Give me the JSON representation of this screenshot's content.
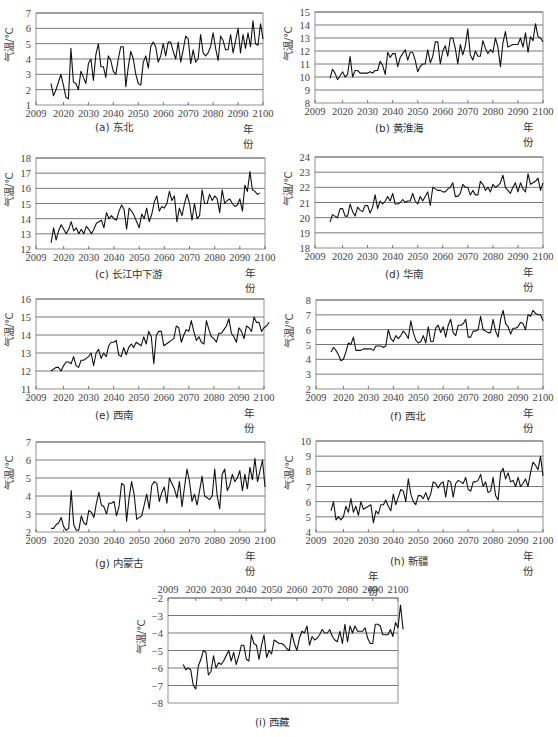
{
  "figure": {
    "ylabel": "气温/℃",
    "xlabel": "年份"
  },
  "chart_data": [
    {
      "id": "a",
      "type": "line",
      "title": "(a) 东北",
      "xlabel": "年份",
      "ylabel": "气温/℃",
      "xlim": [
        2009,
        2100
      ],
      "ylim": [
        1,
        7
      ],
      "grid": true,
      "x_ticks": [
        2009,
        2020,
        2030,
        2040,
        2050,
        2060,
        2070,
        2080,
        2090,
        2100
      ],
      "y_ticks": [
        1,
        2,
        3,
        4,
        5,
        6,
        7
      ],
      "x_start": 2015,
      "values": [
        2.4,
        1.6,
        2.0,
        2.5,
        3.0,
        2.3,
        1.5,
        1.4,
        4.7,
        2.5,
        2.4,
        2.0,
        3.2,
        2.8,
        2.4,
        3.7,
        4.0,
        2.6,
        4.3,
        5.0,
        3.5,
        3.5,
        2.8,
        4.2,
        3.9,
        3.2,
        3.0,
        4.0,
        4.8,
        4.8,
        2.2,
        3.5,
        4.5,
        4.0,
        3.0,
        2.4,
        2.3,
        3.8,
        4.2,
        3.4,
        4.8,
        5.1,
        4.8,
        3.8,
        4.2,
        5.0,
        4.2,
        5.1,
        5.1,
        4.5,
        4.0,
        5.1,
        3.8,
        4.6,
        5.5,
        5.3,
        3.7,
        4.6,
        3.8,
        4.0,
        5.6,
        4.4,
        4.2,
        4.4,
        4.8,
        5.7,
        4.7,
        3.9,
        5.5,
        5.2,
        4.6,
        4.6,
        5.6,
        4.4,
        5.2,
        6.0,
        4.4,
        5.6,
        4.7,
        5.7,
        4.8,
        6.5,
        5.0,
        4.9,
        6.3,
        5.3
      ]
    },
    {
      "id": "b",
      "type": "line",
      "title": "(b) 黄淮海",
      "xlabel": "年份",
      "ylabel": "气温/℃",
      "xlim": [
        2009,
        2100
      ],
      "ylim": [
        8,
        15
      ],
      "grid": true,
      "x_ticks": [
        2009,
        2020,
        2030,
        2040,
        2050,
        2060,
        2070,
        2080,
        2090,
        2100
      ],
      "y_ticks": [
        8,
        9,
        10,
        11,
        12,
        13,
        14,
        15
      ],
      "x_start": 2015,
      "values": [
        9.9,
        10.6,
        10.3,
        9.8,
        10.1,
        10.4,
        10.0,
        10.2,
        11.6,
        10.0,
        10.5,
        10.5,
        10.3,
        10.3,
        10.3,
        10.3,
        10.4,
        10.3,
        10.5,
        10.5,
        11.2,
        10.9,
        10.2,
        11.9,
        11.5,
        11.8,
        11.8,
        10.8,
        11.5,
        11.8,
        12.1,
        11.3,
        11.9,
        11.9,
        11.3,
        10.4,
        10.8,
        11.0,
        11.0,
        12.1,
        11.1,
        11.6,
        12.7,
        12.7,
        11.0,
        12.0,
        12.4,
        11.6,
        13.0,
        13.0,
        12.2,
        11.0,
        12.5,
        11.7,
        12.4,
        13.7,
        11.7,
        11.3,
        12.0,
        11.6,
        11.6,
        12.8,
        12.2,
        11.8,
        12.1,
        11.9,
        13.0,
        12.3,
        10.8,
        12.6,
        13.5,
        12.3,
        12.4,
        12.5,
        12.5,
        12.5,
        13.0,
        12.3,
        13.4,
        11.9,
        13.1,
        12.8,
        14.1,
        13.1,
        13.0,
        12.7
      ]
    },
    {
      "id": "c",
      "type": "line",
      "title": "(c) 长江中下游",
      "xlabel": "年份",
      "ylabel": "气温/℃",
      "xlim": [
        2009,
        2100
      ],
      "ylim": [
        12,
        18
      ],
      "grid": true,
      "x_ticks": [
        2009,
        2020,
        2030,
        2040,
        2050,
        2060,
        2070,
        2080,
        2090,
        2100
      ],
      "y_ticks": [
        12,
        13,
        14,
        15,
        16,
        17,
        18
      ],
      "x_start": 2015,
      "values": [
        12.4,
        13.4,
        12.6,
        13.2,
        13.6,
        13.3,
        13.0,
        13.3,
        13.8,
        13.2,
        13.4,
        13.0,
        13.3,
        13.0,
        13.5,
        13.3,
        13.0,
        13.3,
        13.7,
        13.8,
        13.9,
        13.4,
        14.4,
        14.0,
        14.2,
        14.0,
        13.9,
        14.5,
        14.9,
        14.6,
        13.3,
        14.7,
        14.5,
        14.2,
        13.8,
        13.4,
        14.3,
        14.0,
        14.7,
        13.8,
        14.3,
        15.1,
        15.5,
        14.5,
        14.8,
        14.7,
        15.0,
        15.8,
        15.2,
        15.5,
        13.8,
        14.7,
        14.2,
        15.0,
        15.6,
        15.0,
        13.9,
        15.0,
        14.0,
        14.2,
        15.9,
        15.0,
        15.0,
        15.6,
        15.2,
        15.5,
        15.3,
        14.4,
        15.9,
        15.0,
        15.2,
        15.3,
        15.0,
        14.8,
        14.9,
        15.3,
        14.5,
        16.2,
        15.8,
        17.1,
        15.9,
        15.8,
        15.6,
        15.7
      ]
    },
    {
      "id": "d",
      "type": "line",
      "title": "(d) 华南",
      "xlabel": "年份",
      "ylabel": "气温/℃",
      "xlim": [
        2009,
        2100
      ],
      "ylim": [
        18,
        24
      ],
      "grid": true,
      "x_ticks": [
        2009,
        2020,
        2030,
        2040,
        2050,
        2060,
        2070,
        2080,
        2090,
        2100
      ],
      "y_ticks": [
        18,
        19,
        20,
        21,
        22,
        23,
        24
      ],
      "x_start": 2015,
      "values": [
        19.7,
        20.2,
        20.1,
        20.0,
        20.6,
        20.6,
        20.1,
        20.1,
        20.9,
        20.4,
        20.1,
        20.7,
        20.5,
        20.4,
        20.8,
        20.8,
        20.3,
        20.7,
        21.5,
        20.6,
        21.1,
        20.9,
        21.1,
        21.4,
        21.1,
        21.6,
        20.9,
        20.9,
        21.0,
        21.2,
        21.0,
        21.1,
        21.1,
        21.6,
        21.1,
        20.9,
        21.4,
        21.1,
        21.4,
        21.7,
        20.8,
        22.0,
        21.9,
        21.8,
        21.8,
        21.7,
        21.7,
        21.9,
        22.0,
        22.3,
        21.4,
        21.4,
        21.6,
        22.2,
        22.0,
        22.0,
        21.5,
        21.8,
        21.5,
        21.5,
        22.4,
        22.2,
        21.8,
        22.0,
        21.7,
        22.2,
        22.0,
        22.1,
        22.3,
        22.8,
        22.0,
        21.8,
        21.6,
        22.0,
        22.3,
        21.7,
        22.3,
        21.9,
        21.7,
        22.9,
        22.2,
        22.3,
        22.4,
        22.6,
        21.8,
        22.3
      ]
    },
    {
      "id": "e",
      "type": "line",
      "title": "(e) 西南",
      "xlabel": "年份",
      "ylabel": "气温/℃",
      "xlim": [
        2009,
        2100
      ],
      "ylim": [
        11,
        16
      ],
      "grid": true,
      "x_ticks": [
        2009,
        2020,
        2030,
        2040,
        2050,
        2060,
        2070,
        2080,
        2090,
        2100
      ],
      "y_ticks": [
        11,
        12,
        13,
        14,
        15,
        16
      ],
      "x_start": 2015,
      "values": [
        12.0,
        12.1,
        12.2,
        12.2,
        12.0,
        12.3,
        12.5,
        12.5,
        12.4,
        12.8,
        12.3,
        12.2,
        12.6,
        12.6,
        12.7,
        12.8,
        13.0,
        12.3,
        13.0,
        13.2,
        12.7,
        13.0,
        12.8,
        13.4,
        13.6,
        13.6,
        13.7,
        12.9,
        12.8,
        13.3,
        12.9,
        13.3,
        13.5,
        13.3,
        13.6,
        13.5,
        13.4,
        13.9,
        13.5,
        14.2,
        13.9,
        12.4,
        14.0,
        14.2,
        14.2,
        13.4,
        13.5,
        13.6,
        13.7,
        13.8,
        14.5,
        14.4,
        13.6,
        14.0,
        14.3,
        14.2,
        14.8,
        14.2,
        13.7,
        13.9,
        13.6,
        13.5,
        14.8,
        14.3,
        13.9,
        13.8,
        13.6,
        14.1,
        14.1,
        14.3,
        14.5,
        14.9,
        14.1,
        13.9,
        13.6,
        14.4,
        14.2,
        13.8,
        14.5,
        14.4,
        14.2,
        15.0,
        14.7,
        14.7,
        14.2,
        14.4,
        14.5,
        14.7
      ]
    },
    {
      "id": "f",
      "type": "line",
      "title": "(f) 西北",
      "xlabel": "年份",
      "ylabel": "气温/℃",
      "xlim": [
        2009,
        2100
      ],
      "ylim": [
        2,
        8
      ],
      "grid": true,
      "x_ticks": [
        2009,
        2020,
        2030,
        2040,
        2050,
        2060,
        2070,
        2080,
        2090,
        2100
      ],
      "y_ticks": [
        2,
        3,
        4,
        5,
        6,
        7,
        8
      ],
      "x_start": 2015,
      "values": [
        4.5,
        4.8,
        4.6,
        4.3,
        3.9,
        4.0,
        4.5,
        5.1,
        5.0,
        5.5,
        4.6,
        4.6,
        4.6,
        4.7,
        4.7,
        4.7,
        4.7,
        4.6,
        4.9,
        4.9,
        4.9,
        4.8,
        4.9,
        6.0,
        5.4,
        5.2,
        5.6,
        5.4,
        5.6,
        5.9,
        5.7,
        5.4,
        6.6,
        5.8,
        5.3,
        5.1,
        5.2,
        5.6,
        5.1,
        6.2,
        5.2,
        5.2,
        6.1,
        6.3,
        5.8,
        6.2,
        5.5,
        6.3,
        6.7,
        5.8,
        5.6,
        6.3,
        6.3,
        6.4,
        6.7,
        5.5,
        5.5,
        5.9,
        5.9,
        6.0,
        6.9,
        6.0,
        5.9,
        5.8,
        5.8,
        6.7,
        5.9,
        5.5,
        6.7,
        7.3,
        6.4,
        6.2,
        5.7,
        6.1,
        6.1,
        6.2,
        6.5,
        6.4,
        6.0,
        7.0,
        6.9,
        7.3,
        7.1,
        7.0,
        7.0,
        6.6
      ]
    },
    {
      "id": "g",
      "type": "line",
      "title": "(g) 内蒙古",
      "xlabel": "年份",
      "ylabel": "气温/℃",
      "xlim": [
        2009,
        2100
      ],
      "ylim": [
        2,
        7
      ],
      "grid": true,
      "x_ticks": [
        2009,
        2020,
        2030,
        2040,
        2050,
        2060,
        2070,
        2080,
        2090,
        2100
      ],
      "y_ticks": [
        2,
        3,
        4,
        5,
        6,
        7
      ],
      "x_start": 2015,
      "values": [
        2.2,
        2.2,
        2.4,
        2.5,
        2.8,
        2.3,
        2.1,
        2.2,
        4.3,
        2.4,
        2.1,
        2.1,
        2.9,
        2.5,
        2.4,
        3.2,
        3.1,
        2.8,
        3.6,
        4.2,
        3.5,
        3.4,
        3.0,
        3.6,
        3.6,
        3.7,
        2.9,
        3.4,
        4.7,
        4.6,
        2.6,
        3.9,
        4.8,
        4.1,
        2.7,
        2.8,
        2.9,
        3.5,
        4.1,
        3.3,
        4.6,
        4.8,
        4.7,
        3.7,
        4.2,
        4.5,
        3.6,
        5.0,
        4.7,
        4.4,
        3.9,
        4.8,
        3.4,
        4.5,
        5.5,
        4.8,
        3.7,
        4.1,
        3.5,
        4.3,
        5.1,
        4.0,
        3.9,
        3.8,
        4.0,
        5.5,
        4.0,
        3.3,
        5.2,
        5.5,
        4.3,
        4.6,
        5.2,
        4.8,
        5.0,
        5.4,
        4.3,
        5.2,
        4.4,
        5.6,
        4.9,
        6.1,
        4.8,
        5.4,
        6.0,
        4.5
      ]
    },
    {
      "id": "h",
      "type": "line",
      "title": "(h) 新疆",
      "xlabel": "年份",
      "ylabel": "气温/℃",
      "xlim": [
        2009,
        2100
      ],
      "ylim": [
        4,
        10
      ],
      "grid": true,
      "x_ticks": [
        2009,
        2020,
        2030,
        2040,
        2050,
        2060,
        2070,
        2080,
        2090,
        2100
      ],
      "y_ticks": [
        4,
        5,
        6,
        7,
        8,
        9,
        10
      ],
      "x_start": 2015,
      "values": [
        5.4,
        6.0,
        4.8,
        5.0,
        4.8,
        5.0,
        5.7,
        5.3,
        6.2,
        5.3,
        5.7,
        5.1,
        6.0,
        5.5,
        5.6,
        5.7,
        5.8,
        4.6,
        5.4,
        5.2,
        5.8,
        5.8,
        6.1,
        5.7,
        5.4,
        6.5,
        5.8,
        6.3,
        6.8,
        6.7,
        6.0,
        7.5,
        6.5,
        6.0,
        5.8,
        6.4,
        6.4,
        6.2,
        6.6,
        6.1,
        6.5,
        7.3,
        7.2,
        6.9,
        7.2,
        7.3,
        6.3,
        7.4,
        7.3,
        6.3,
        7.2,
        7.4,
        7.3,
        7.2,
        7.6,
        6.8,
        6.7,
        7.3,
        7.3,
        7.4,
        7.8,
        7.0,
        7.3,
        6.6,
        6.7,
        7.6,
        6.4,
        6.1,
        7.9,
        8.2,
        7.5,
        7.9,
        7.3,
        7.4,
        7.0,
        7.6,
        7.0,
        7.2,
        7.5,
        7.0,
        7.9,
        8.6,
        8.4,
        8.1,
        9.0,
        7.7
      ]
    },
    {
      "id": "i",
      "type": "line",
      "title": "(i) 西藏",
      "xlabel": "年份",
      "ylabel": "气温/℃",
      "xlim": [
        2009,
        2100
      ],
      "ylim": [
        -8,
        -2
      ],
      "grid": true,
      "x_axis_position": "top",
      "x_ticks": [
        2009,
        2020,
        2030,
        2040,
        2050,
        2060,
        2070,
        2080,
        2090,
        2100
      ],
      "y_ticks": [
        -2,
        -3,
        -4,
        -5,
        -6,
        -7,
        -8
      ],
      "x_start": 2015,
      "values": [
        -5.8,
        -6.1,
        -6.0,
        -6.1,
        -7.0,
        -7.2,
        -5.9,
        -5.5,
        -5.0,
        -5.1,
        -6.4,
        -6.2,
        -5.3,
        -6.0,
        -5.7,
        -5.8,
        -5.6,
        -5.3,
        -5.0,
        -5.6,
        -5.1,
        -5.8,
        -5.3,
        -4.7,
        -4.7,
        -5.5,
        -5.6,
        -4.1,
        -4.6,
        -4.7,
        -5.5,
        -4.7,
        -4.1,
        -5.4,
        -5.0,
        -5.2,
        -4.4,
        -4.5,
        -4.6,
        -4.6,
        -4.7,
        -4.9,
        -5.0,
        -4.0,
        -4.6,
        -5.0,
        -4.3,
        -3.9,
        -4.0,
        -3.6,
        -4.7,
        -4.2,
        -4.4,
        -4.3,
        -4.1,
        -3.8,
        -4.0,
        -4.0,
        -3.8,
        -4.2,
        -4.4,
        -4.5,
        -3.9,
        -4.6,
        -3.5,
        -4.5,
        -3.6,
        -4.0,
        -3.6,
        -3.9,
        -3.9,
        -3.9,
        -3.7,
        -4.3,
        -4.6,
        -4.6,
        -3.5,
        -3.5,
        -3.6,
        -4.1,
        -4.1,
        -4.1,
        -3.8,
        -4.2,
        -3.4,
        -3.7,
        -2.4,
        -3.8
      ]
    }
  ]
}
